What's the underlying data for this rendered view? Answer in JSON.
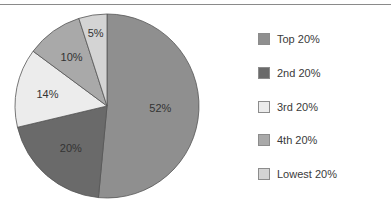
{
  "chart_data": {
    "type": "pie",
    "title": "",
    "categories": [
      "Top 20%",
      "2nd 20%",
      "3rd 20%",
      "4th 20%",
      "Lowest 20%"
    ],
    "values": [
      52,
      20,
      14,
      10,
      5
    ],
    "labels": [
      "52%",
      "20%",
      "14%",
      "10%",
      "5%"
    ],
    "colors": [
      "#8f8f8f",
      "#6a6a6a",
      "#ececec",
      "#a9a9a9",
      "#d4d4d4"
    ],
    "start_angle_deg": 0,
    "direction": "clockwise",
    "legend_position": "right"
  },
  "legend": {
    "items": [
      {
        "label": "Top 20%",
        "color": "#8f8f8f"
      },
      {
        "label": "2nd 20%",
        "color": "#6a6a6a"
      },
      {
        "label": "3rd 20%",
        "color": "#ececec"
      },
      {
        "label": "4th 20%",
        "color": "#a9a9a9"
      },
      {
        "label": "Lowest 20%",
        "color": "#d4d4d4"
      }
    ]
  }
}
